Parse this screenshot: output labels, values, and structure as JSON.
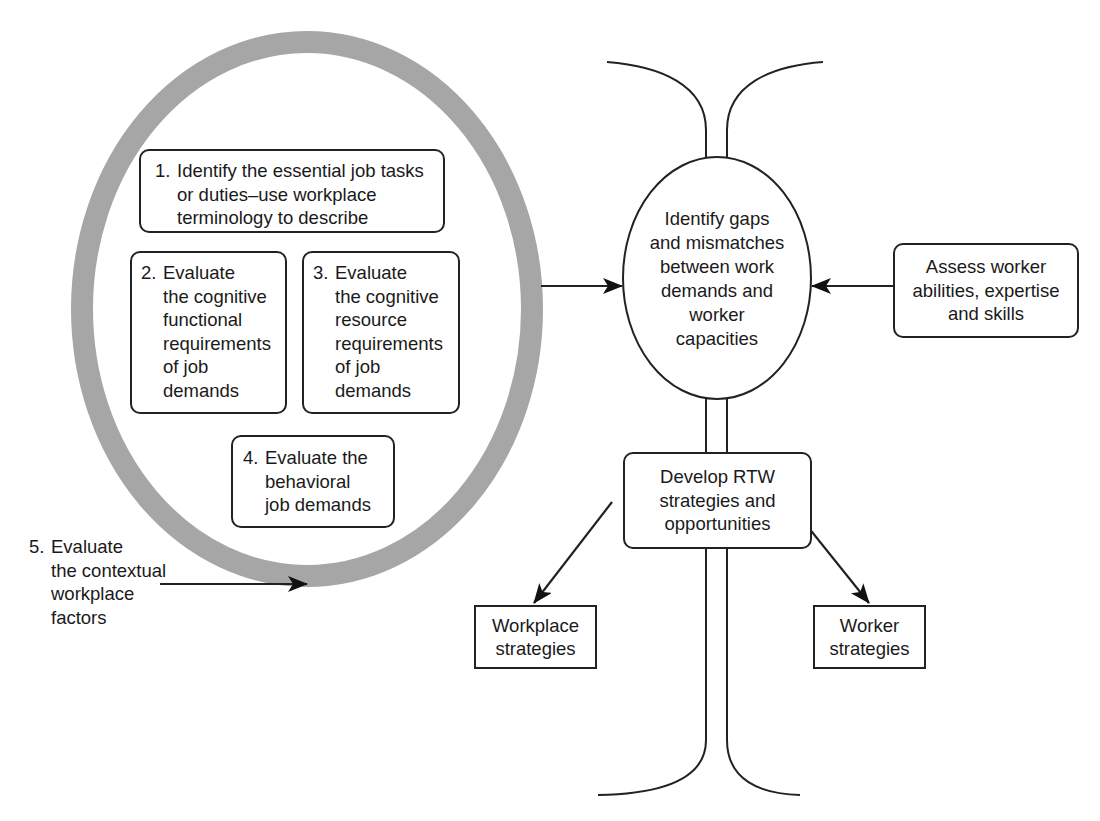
{
  "diagram": {
    "ring": {
      "color": "#a6a6a6",
      "label": "job-demands-cycle"
    },
    "steps": [
      {
        "id": "step-1",
        "number": "1.",
        "lines": [
          "Identify the essential job tasks",
          "or duties–use workplace",
          "terminology to describe"
        ]
      },
      {
        "id": "step-2",
        "number": "2.",
        "lines": [
          "Evaluate",
          "the cognitive",
          "functional",
          "requirements",
          "of job",
          "demands"
        ]
      },
      {
        "id": "step-3",
        "number": "3.",
        "lines": [
          "Evaluate",
          "the cognitive",
          "resource",
          "requirements",
          "of job",
          "demands"
        ]
      },
      {
        "id": "step-4",
        "number": "4.",
        "lines": [
          "Evaluate the",
          "behavioral",
          "job demands"
        ]
      },
      {
        "id": "step-5",
        "number": "5.",
        "lines": [
          "Evaluate",
          "the contextual",
          "workplace",
          "factors"
        ]
      }
    ],
    "gap_node": {
      "lines": [
        "Identify gaps",
        "and mismatches",
        "between work",
        "demands and",
        "worker",
        "capacities"
      ]
    },
    "assess_node": {
      "lines": [
        "Assess worker",
        "abilities, expertise",
        "and skills"
      ]
    },
    "rtw_node": {
      "lines": [
        "Develop RTW",
        "strategies and",
        "opportunities"
      ]
    },
    "outcomes": [
      {
        "id": "workplace",
        "lines": [
          "Workplace",
          "strategies"
        ]
      },
      {
        "id": "worker",
        "lines": [
          "Worker",
          "strategies"
        ]
      }
    ]
  }
}
